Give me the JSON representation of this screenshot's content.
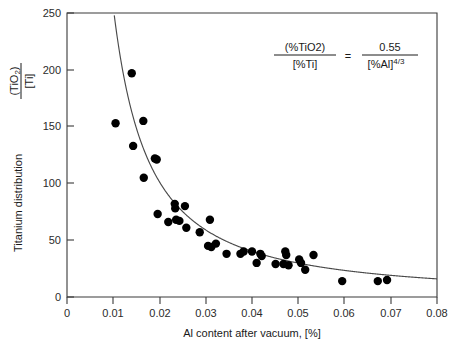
{
  "chart_data": {
    "type": "scatter",
    "title": "",
    "xlabel": "Al content after vacuum, [%]",
    "ylabel": "Titanium distribution (TiO2)/[Ti]",
    "ylabel_parts": {
      "prefix": "Titanium distribution",
      "numerator": "(TiO",
      "numerator_sub": "2",
      "numerator_close": ")",
      "denominator": "[Ti]"
    },
    "xlim": [
      0,
      0.08
    ],
    "ylim": [
      0,
      250
    ],
    "xticks": [
      0,
      0.01,
      0.02,
      0.03,
      0.04,
      0.05,
      0.06,
      0.07,
      0.08
    ],
    "xticklabels": [
      "0",
      "0.01",
      "0.02",
      "0.03",
      "0.04",
      "0.05",
      "0.06",
      "0.07",
      "0.08"
    ],
    "yticks": [
      0,
      50,
      100,
      150,
      200,
      250
    ],
    "yticklabels": [
      "0",
      "50",
      "100",
      "150",
      "200",
      "250"
    ],
    "grid": false,
    "legend": "none",
    "marker": "filled-circle",
    "marker_color": "#000000",
    "curve_color": "#4a4a4a",
    "series": [
      {
        "name": "Measured titanium distribution",
        "points": [
          [
            0.0105,
            153
          ],
          [
            0.014,
            197
          ],
          [
            0.0143,
            133
          ],
          [
            0.0165,
            155
          ],
          [
            0.0166,
            105
          ],
          [
            0.019,
            122
          ],
          [
            0.0194,
            121
          ],
          [
            0.0196,
            73
          ],
          [
            0.0219,
            66
          ],
          [
            0.0233,
            82
          ],
          [
            0.0234,
            78
          ],
          [
            0.0236,
            68
          ],
          [
            0.0243,
            67
          ],
          [
            0.0255,
            80
          ],
          [
            0.0258,
            61
          ],
          [
            0.0287,
            57
          ],
          [
            0.0305,
            45
          ],
          [
            0.0309,
            68
          ],
          [
            0.0312,
            44
          ],
          [
            0.0322,
            47
          ],
          [
            0.0345,
            38
          ],
          [
            0.0375,
            38
          ],
          [
            0.0382,
            40
          ],
          [
            0.04,
            40
          ],
          [
            0.041,
            30
          ],
          [
            0.0418,
            38
          ],
          [
            0.0421,
            36
          ],
          [
            0.0451,
            29
          ],
          [
            0.0468,
            29
          ],
          [
            0.0472,
            40
          ],
          [
            0.0474,
            37
          ],
          [
            0.0479,
            28
          ],
          [
            0.0502,
            33
          ],
          [
            0.0506,
            30
          ],
          [
            0.0515,
            24
          ],
          [
            0.0533,
            37
          ],
          [
            0.0595,
            14
          ],
          [
            0.0672,
            14
          ],
          [
            0.0692,
            15
          ]
        ]
      }
    ],
    "model": {
      "name": "equilibrium-relation",
      "expression": "0.55 / x^(4/3)",
      "coefficient": 0.55,
      "exponent": "4/3"
    },
    "annotation": {
      "name": "equilibrium-equation",
      "lhs_numerator": "(%TiO2)",
      "lhs_denominator": "[%Ti]",
      "equals": "=",
      "rhs_numerator": "0.55",
      "rhs_denominator": "[%Al]",
      "rhs_exponent": "4/3"
    }
  }
}
